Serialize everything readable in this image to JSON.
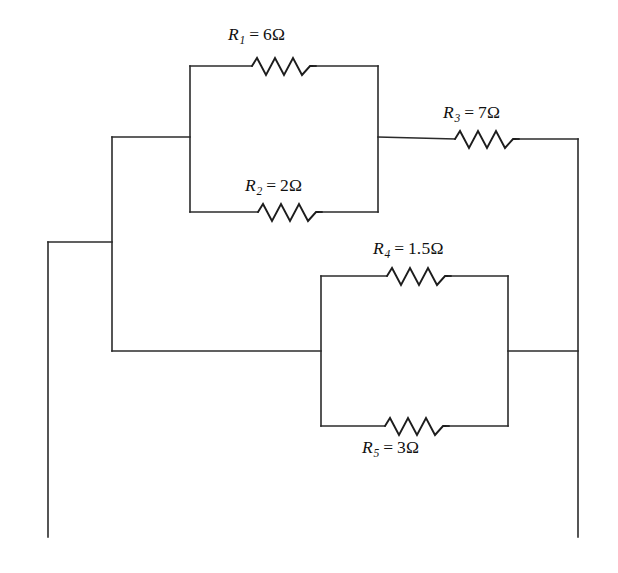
{
  "figure": {
    "name": "resistor-network-circuit-diagram",
    "type": "schematic",
    "background_color": "#ffffff",
    "wire_color": "#2b2b2b",
    "text_color": "#111111"
  },
  "resistors": [
    {
      "id": "r1",
      "symbol": "R",
      "subscript": "1",
      "equals": "=",
      "value": "6",
      "unit": "Ω",
      "label_text": "R₁ = 6Ω",
      "label_position": "above",
      "branch": "upper-parallel-top"
    },
    {
      "id": "r2",
      "symbol": "R",
      "subscript": "2",
      "equals": "=",
      "value": "2",
      "unit": "Ω",
      "label_text": "R₂ = 2Ω",
      "label_position": "above",
      "branch": "upper-parallel-bottom"
    },
    {
      "id": "r3",
      "symbol": "R",
      "subscript": "3",
      "equals": "=",
      "value": "7",
      "unit": "Ω",
      "label_text": "R₃ = 7Ω",
      "label_position": "above",
      "branch": "series-right"
    },
    {
      "id": "r4",
      "symbol": "R",
      "subscript": "4",
      "equals": "=",
      "value": "1.5",
      "unit": "Ω",
      "label_text": "R₄ = 1.5Ω",
      "label_position": "above",
      "branch": "lower-parallel-top"
    },
    {
      "id": "r5",
      "symbol": "R",
      "subscript": "5",
      "equals": "=",
      "value": "3",
      "unit": "Ω",
      "label_text": "R₅ = 3Ω",
      "label_position": "below",
      "branch": "lower-parallel-bottom"
    }
  ]
}
